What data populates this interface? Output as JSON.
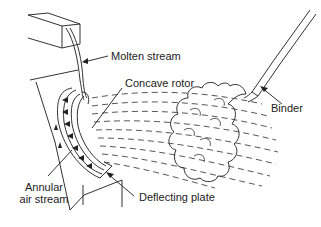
{
  "diagram": {
    "type": "process schematic",
    "labels": {
      "molten_stream": "Molten stream",
      "concave_rotor": "Concave rotor",
      "binder": "Binder",
      "annular_air_stream_line1": "Annular",
      "annular_air_stream_line2": "air stream",
      "deflecting_plate": "Deflecting plate"
    },
    "colors": {
      "line": "#333333",
      "background": "#ffffff",
      "text": "#222222"
    }
  }
}
